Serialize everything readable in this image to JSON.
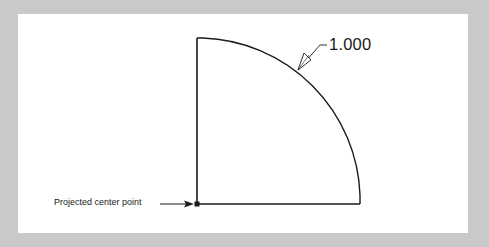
{
  "figure": {
    "background_color": "#c9c9c9",
    "panel_color": "#ffffff",
    "line_color": "#1a1a1a"
  },
  "annotations": {
    "radius_dimension": "1.000",
    "center_point_label": "Projected center point"
  },
  "geometry": {
    "shape": "quarter-circle sector",
    "center": [
      197,
      204
    ],
    "radius_px": 163
  }
}
